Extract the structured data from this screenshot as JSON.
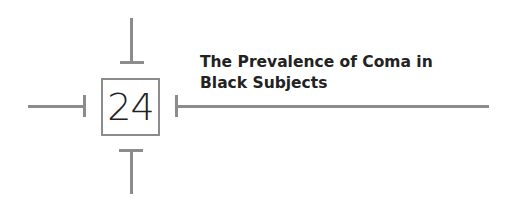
{
  "chapter": {
    "number": "24",
    "title_line1": "The Prevalence of Coma in",
    "title_line2": "Black Subjects"
  },
  "colors": {
    "rule": "#8c8c8c",
    "text": "#222222",
    "background": "#ffffff"
  }
}
